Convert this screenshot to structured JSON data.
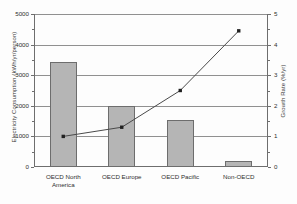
{
  "chart_data": {
    "type": "bar",
    "title": "",
    "subtitle": "",
    "xlabel": "",
    "ylabel": "Electricity Consumption (kWh/yr/person)",
    "y2label": "Growth Rate (%/yr)",
    "categories": [
      "OECD North\nAmerica",
      "OECD Europe",
      "OECD Pacific",
      "Non-OECD"
    ],
    "series": [
      {
        "name": "Electricity Consumption",
        "type": "bar",
        "axis": "left",
        "values": [
          3430,
          1990,
          1530,
          190
        ]
      },
      {
        "name": "Growth Rate",
        "type": "line",
        "axis": "right",
        "values": [
          1.0,
          1.3,
          2.5,
          4.45
        ]
      }
    ],
    "ylim": [
      0,
      5000
    ],
    "y2lim": [
      0,
      5
    ],
    "yticks": [
      "0",
      "1000",
      "2000",
      "3000",
      "4000",
      "5000"
    ],
    "ytick_values": [
      0,
      1000,
      2000,
      3000,
      4000,
      5000
    ],
    "y2ticks": [
      "0",
      "1",
      "2",
      "3",
      "4",
      "5"
    ],
    "y2tick_values": [
      0,
      1,
      2,
      3,
      4,
      5
    ],
    "grid": true,
    "legend": false,
    "bar_color": "#b5b5b5",
    "bar_border_color": "#6d6d6d",
    "line_color": "#4a4a4a",
    "marker_color": "#202020",
    "grid_color": "#909090",
    "axis_color": "#6e6e6e"
  }
}
